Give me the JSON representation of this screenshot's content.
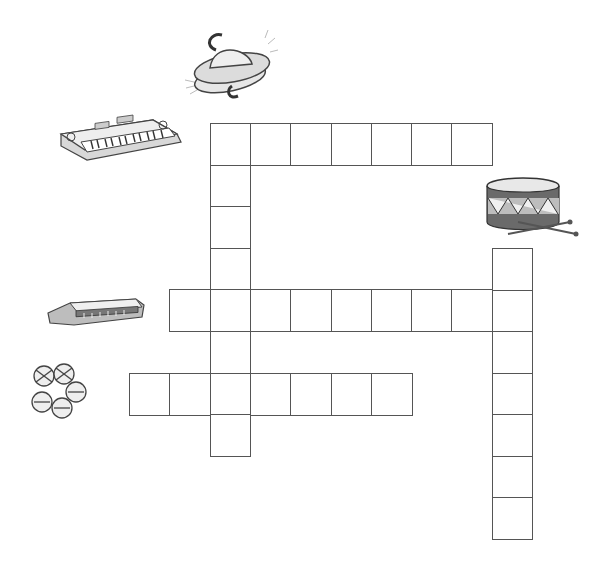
{
  "puzzle": {
    "type": "picture crossword",
    "line_color": "#555555",
    "grid_origin": {
      "x": 129,
      "y": 123
    },
    "cell_width": 40.3,
    "cell_height": 41.6
  },
  "clues": [
    {
      "id": "cymbals",
      "picture": "cymbals-icon",
      "direction": "down",
      "length": 8,
      "start": {
        "col": 2,
        "row": 0
      }
    },
    {
      "id": "keyboard",
      "picture": "keyboard-icon",
      "direction": "across",
      "length": 7,
      "start": {
        "col": 2,
        "row": 0
      }
    },
    {
      "id": "drum",
      "picture": "drum-icon",
      "direction": "down",
      "length": 7,
      "start": {
        "col": 9,
        "row": 3
      }
    },
    {
      "id": "harmonica",
      "picture": "harmonica-icon",
      "direction": "across",
      "length": 9,
      "start": {
        "col": 1,
        "row": 4
      }
    },
    {
      "id": "bells",
      "picture": "bells-icon",
      "direction": "across",
      "length": 7,
      "start": {
        "col": 0,
        "row": 6
      }
    }
  ],
  "cells": [
    {
      "col": 2,
      "row": 0,
      "value": ""
    },
    {
      "col": 3,
      "row": 0,
      "value": ""
    },
    {
      "col": 4,
      "row": 0,
      "value": ""
    },
    {
      "col": 5,
      "row": 0,
      "value": ""
    },
    {
      "col": 6,
      "row": 0,
      "value": ""
    },
    {
      "col": 7,
      "row": 0,
      "value": ""
    },
    {
      "col": 8,
      "row": 0,
      "value": ""
    },
    {
      "col": 2,
      "row": 1,
      "value": ""
    },
    {
      "col": 2,
      "row": 2,
      "value": ""
    },
    {
      "col": 2,
      "row": 3,
      "value": ""
    },
    {
      "col": 1,
      "row": 4,
      "value": ""
    },
    {
      "col": 2,
      "row": 4,
      "value": ""
    },
    {
      "col": 3,
      "row": 4,
      "value": ""
    },
    {
      "col": 4,
      "row": 4,
      "value": ""
    },
    {
      "col": 5,
      "row": 4,
      "value": ""
    },
    {
      "col": 6,
      "row": 4,
      "value": ""
    },
    {
      "col": 7,
      "row": 4,
      "value": ""
    },
    {
      "col": 8,
      "row": 4,
      "value": ""
    },
    {
      "col": 9,
      "row": 4,
      "value": ""
    },
    {
      "col": 2,
      "row": 5,
      "value": ""
    },
    {
      "col": 0,
      "row": 6,
      "value": ""
    },
    {
      "col": 1,
      "row": 6,
      "value": ""
    },
    {
      "col": 2,
      "row": 6,
      "value": ""
    },
    {
      "col": 3,
      "row": 6,
      "value": ""
    },
    {
      "col": 4,
      "row": 6,
      "value": ""
    },
    {
      "col": 5,
      "row": 6,
      "value": ""
    },
    {
      "col": 6,
      "row": 6,
      "value": ""
    },
    {
      "col": 2,
      "row": 7,
      "value": ""
    },
    {
      "col": 9,
      "row": 3,
      "value": ""
    },
    {
      "col": 9,
      "row": 5,
      "value": ""
    },
    {
      "col": 9,
      "row": 6,
      "value": ""
    },
    {
      "col": 9,
      "row": 7,
      "value": ""
    },
    {
      "col": 9,
      "row": 8,
      "value": ""
    },
    {
      "col": 9,
      "row": 9,
      "value": ""
    }
  ]
}
